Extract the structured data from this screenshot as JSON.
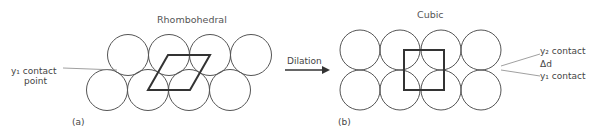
{
  "panel_a": {
    "title": "Rhombohedral",
    "tag": "(a)",
    "contact_label_line1": "y₁ contact",
    "contact_label_line2": "point",
    "circles_top": [
      [
        128,
        55
      ],
      [
        169,
        55
      ],
      [
        210,
        55
      ],
      [
        251,
        55
      ]
    ],
    "circles_bottom": [
      [
        107,
        90
      ],
      [
        148,
        90
      ],
      [
        189,
        90
      ],
      [
        230,
        90
      ]
    ],
    "radius": 20.5,
    "rhombus": "148,90 190,90 210,55 168,55"
  },
  "arrow": {
    "label": "Dilation"
  },
  "panel_b": {
    "title": "Cubic",
    "tag": "(b)",
    "y2_label": "y₂ contact",
    "delta_label": "Δd",
    "y1_label": "y₁ contact",
    "circles_top": [
      [
        360,
        50
      ],
      [
        400,
        50
      ],
      [
        441,
        50
      ],
      [
        481,
        50
      ]
    ],
    "circles_bottom": [
      [
        360,
        90
      ],
      [
        400,
        90
      ],
      [
        441,
        90
      ],
      [
        481,
        90
      ]
    ],
    "radius": 20,
    "square": {
      "x": 404,
      "y": 50,
      "w": 40,
      "h": 40
    }
  },
  "colors": {
    "circle_stroke": "#555555",
    "shape_stroke": "#333333",
    "leader_line": "#888888"
  }
}
